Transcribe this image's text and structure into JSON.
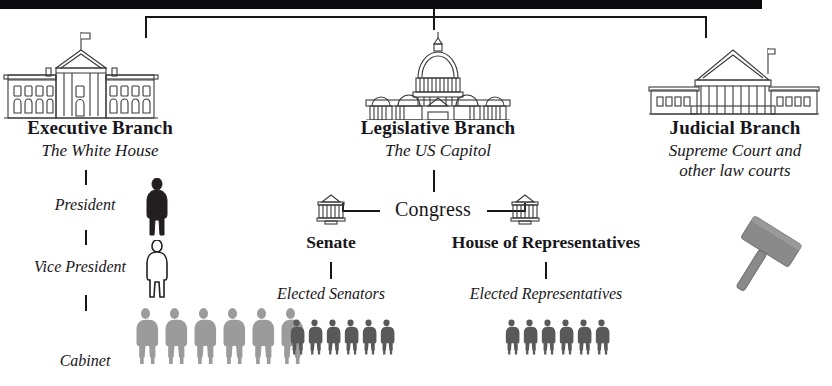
{
  "diagram": {
    "title_bar": "",
    "root_connector": "three-branch-split",
    "branches": [
      {
        "id": "executive",
        "title": "Executive Branch",
        "subtitle": "The White House",
        "icon": "white-house-icon",
        "nodes": [
          {
            "label": "President",
            "style": "italic",
            "figure": "person-dark",
            "figure_color": "#231f20",
            "count": 1
          },
          {
            "label": "Vice President",
            "style": "italic",
            "figure": "person-outline",
            "figure_color": "#ffffff",
            "count": 1
          },
          {
            "label": "Cabinet",
            "style": "italic",
            "figure": "person-light-gray",
            "figure_color": "#9b9b9b",
            "count": 6
          }
        ]
      },
      {
        "id": "legislative",
        "title": "Legislative Branch",
        "subtitle": "The US Capitol",
        "icon": "capitol-icon",
        "center_label": "Congress",
        "chambers": [
          {
            "name": "Senate",
            "icon": "senate-building-icon",
            "members_label": "Elected Senators",
            "figure": "person-gray",
            "figure_color": "#595959",
            "count": 6
          },
          {
            "name": "House of Representatives",
            "icon": "house-building-icon",
            "members_label": "Elected Representatives",
            "figure": "person-gray",
            "figure_color": "#595959",
            "count": 6
          }
        ]
      },
      {
        "id": "judicial",
        "title": "Judicial Branch",
        "subtitle_line1": "Supreme Court and",
        "subtitle_line2": "other law courts",
        "icon": "supreme-court-icon",
        "symbol": "gavel-icon",
        "symbol_color": "#8a8a8a"
      }
    ]
  },
  "colors": {
    "ink": "#17161a",
    "bar": "#0b0b0d",
    "person_dark": "#231f20",
    "person_gray": "#595959",
    "person_light": "#9b9b9b",
    "gavel": "#8a8a8a",
    "line": "#3a3a3a"
  }
}
